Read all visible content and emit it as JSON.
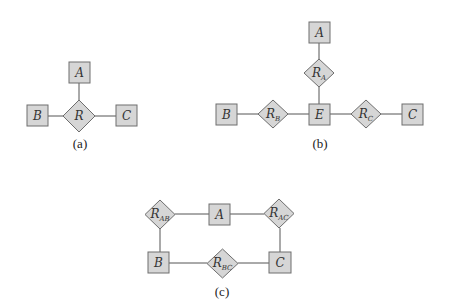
{
  "diagrams": {
    "a": {
      "caption": "(a)",
      "relationship": {
        "main": "R",
        "sub": ""
      },
      "entities": {
        "A": "A",
        "B": "B",
        "C": "C"
      }
    },
    "b": {
      "caption": "(b)",
      "entities": {
        "A": "A",
        "B": "B",
        "C": "C",
        "E": "E"
      },
      "relationships": {
        "RA": {
          "main": "R",
          "sub": "A"
        },
        "RB": {
          "main": "R",
          "sub": "B"
        },
        "RC": {
          "main": "R",
          "sub": "C"
        }
      }
    },
    "c": {
      "caption": "(c)",
      "entities": {
        "A": "A",
        "B": "B",
        "C": "C"
      },
      "relationships": {
        "RAB": {
          "main": "R",
          "sub": "AB"
        },
        "RAC": {
          "main": "R",
          "sub": "AC"
        },
        "RBC": {
          "main": "R",
          "sub": "BC"
        }
      }
    }
  },
  "colors": {
    "shape_fill": "#d6d6d6",
    "shape_stroke": "#6e6e6e",
    "edge": "#555555"
  }
}
